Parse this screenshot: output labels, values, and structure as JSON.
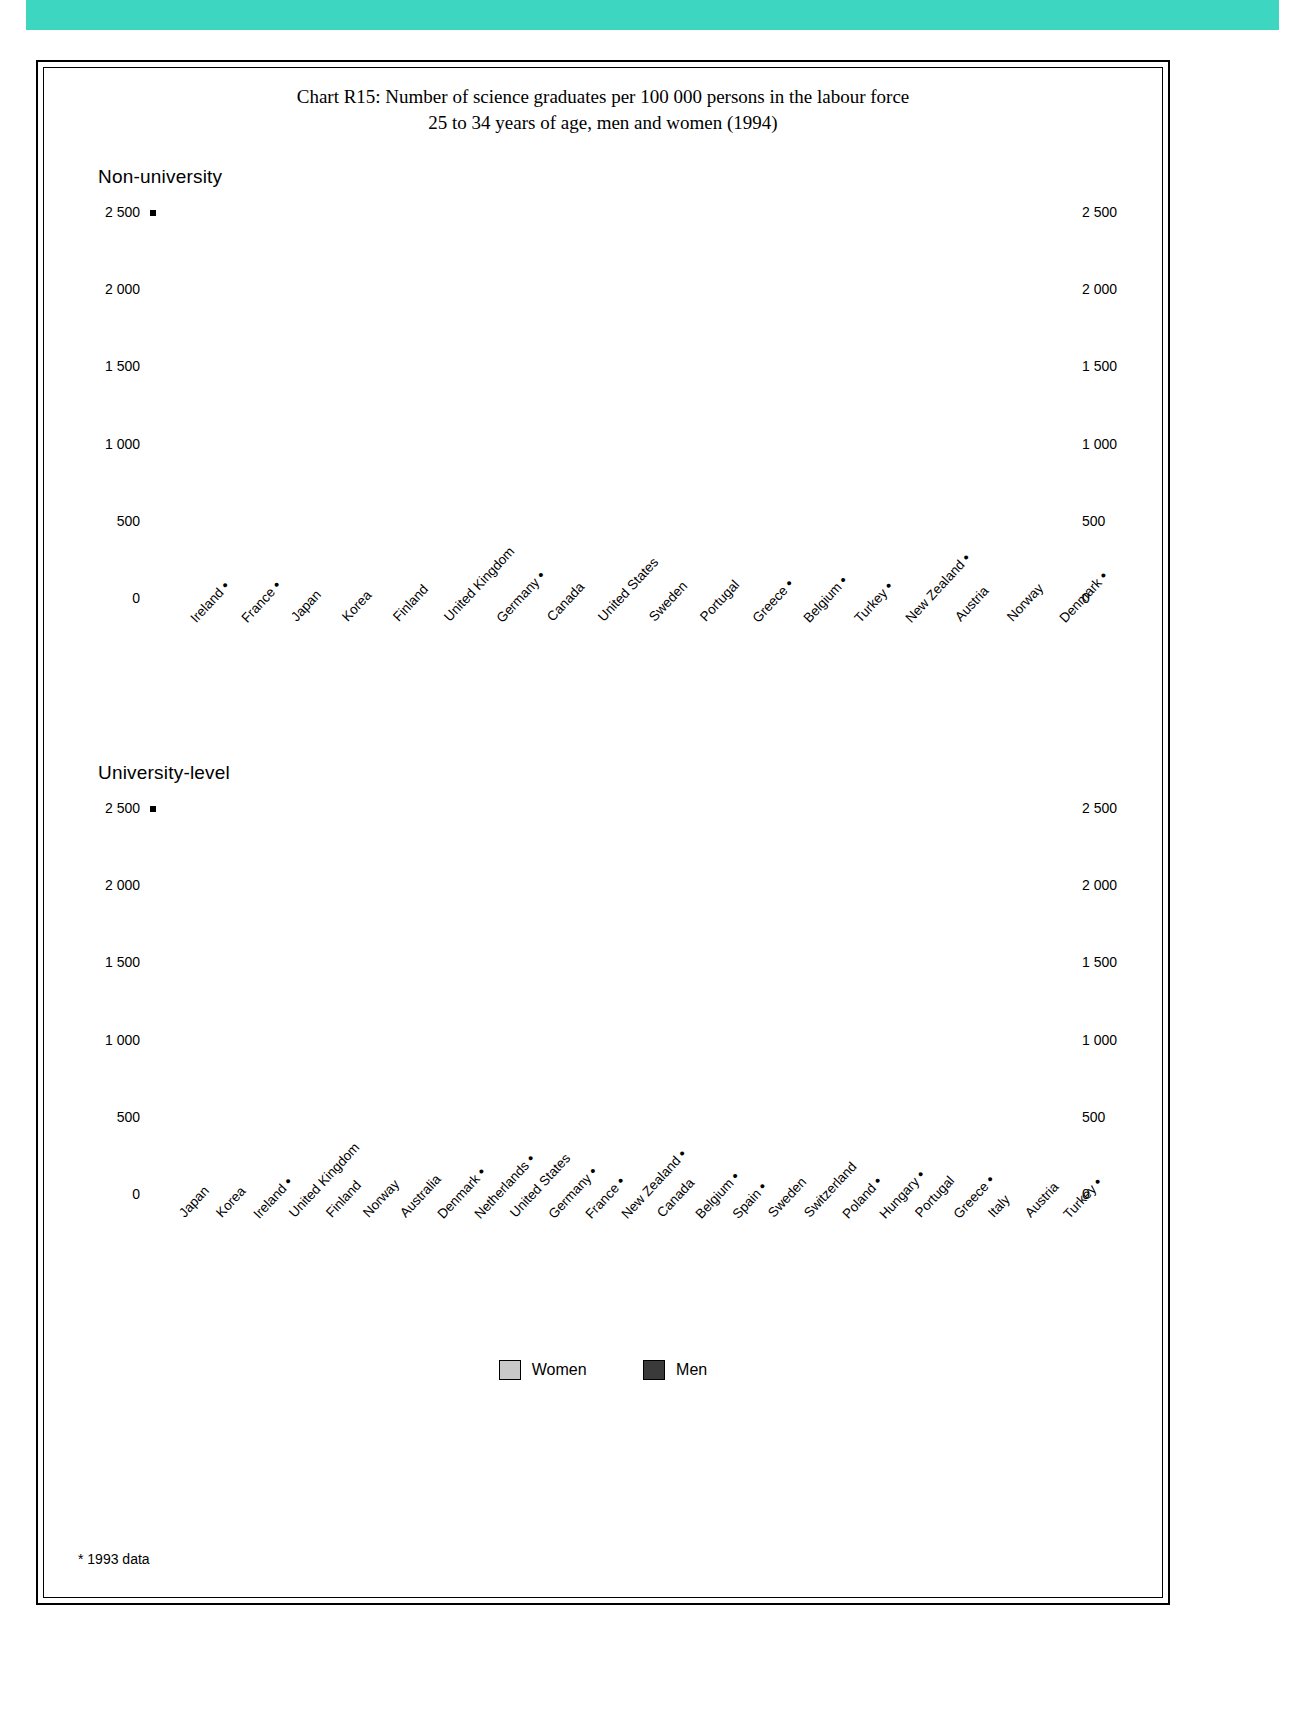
{
  "title_line1": "Chart R15: Number of science graduates per 100 000 persons in the labour force",
  "title_line2": "25 to 34 years of age, men and women (1994)",
  "panel1_label": "Non-university",
  "panel2_label": "University-level",
  "legend": {
    "women": "Women",
    "men": "Men"
  },
  "footnote": "* 1993 data",
  "axis_ticks": [
    "2 500",
    "2 000",
    "1 500",
    "1 000",
    "500",
    "0"
  ],
  "chart_data": [
    {
      "type": "bar",
      "title": "Non-university",
      "xlabel": "",
      "ylabel": "",
      "ylim": [
        0,
        2500
      ],
      "yticks": [
        0,
        500,
        1000,
        1500,
        2000,
        2500
      ],
      "grid": true,
      "legend_position": "bottom",
      "categories": [
        "Ireland *",
        "France *",
        "Japan",
        "Korea",
        "Finland",
        "United Kingdom",
        "Germany *",
        "Canada",
        "United States",
        "Sweden",
        "Portugal",
        "Greece *",
        "Belgium *",
        "Turkey *",
        "New Zealand *",
        "Austria",
        "Norway",
        "Denmark *"
      ],
      "series": [
        {
          "name": "Women",
          "values": [
            1000,
            610,
            2000,
            1055,
            480,
            440,
            115,
            175,
            240,
            65,
            125,
            160,
            130,
            80,
            130,
            60,
            75,
            15
          ]
        },
        {
          "name": "Men",
          "values": [
            1775,
            1225,
            1150,
            1055,
            945,
            765,
            500,
            420,
            360,
            300,
            250,
            250,
            220,
            220,
            125,
            70,
            80,
            25
          ]
        }
      ]
    },
    {
      "type": "bar",
      "title": "University-level",
      "xlabel": "",
      "ylabel": "",
      "ylim": [
        0,
        2500
      ],
      "yticks": [
        0,
        500,
        1000,
        1500,
        2000,
        2500
      ],
      "grid": true,
      "legend_position": "bottom",
      "categories": [
        "Japan",
        "Korea",
        "Ireland *",
        "United Kingdom",
        "Finland",
        "Norway",
        "Australia",
        "Denmark *",
        "Netherlands *",
        "United States",
        "Germany *",
        "France *",
        "New Zealand *",
        "Canada",
        "Belgium *",
        "Spain *",
        "Sweden",
        "Switzerland",
        "Poland *",
        "Hungary *",
        "Portugal",
        "Greece *",
        "Italy",
        "Austria",
        "Turkey *"
      ],
      "series": [
        {
          "name": "Women",
          "values": [
            490,
            1275,
            1045,
            815,
            480,
            605,
            955,
            455,
            340,
            650,
            390,
            495,
            665,
            505,
            355,
            510,
            340,
            215,
            355,
            185,
            400,
            400,
            385,
            185,
            545
          ]
        },
        {
          "name": "Men",
          "values": [
            1670,
            1500,
            1490,
            1480,
            1475,
            1410,
            1395,
            1090,
            1090,
            1090,
            1020,
            960,
            960,
            875,
            870,
            785,
            770,
            595,
            595,
            560,
            560,
            500,
            470,
            465,
            400
          ]
        }
      ]
    }
  ]
}
